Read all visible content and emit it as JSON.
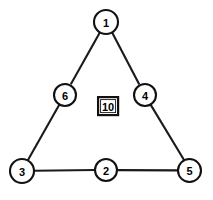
{
  "diagram": {
    "type": "magic-triangle-graph",
    "canvas": {
      "width": 213,
      "height": 200,
      "background": "#ffffff"
    },
    "style": {
      "line_color": "#1a1a1a",
      "node_fill": "#ffffff",
      "node_stroke": "#111111",
      "label_color": "#000000",
      "stroke_width": 2.1
    },
    "nodes": [
      {
        "id": "n1",
        "label": "1",
        "cx": 106,
        "cy": 22,
        "r": 12,
        "role": "apex-vertex"
      },
      {
        "id": "n6",
        "label": "6",
        "cx": 65,
        "cy": 95,
        "r": 11,
        "role": "left-side-midpoint"
      },
      {
        "id": "n4",
        "label": "4",
        "cx": 145,
        "cy": 95,
        "r": 11,
        "role": "right-side-midpoint"
      },
      {
        "id": "n3",
        "label": "3",
        "cx": 22,
        "cy": 171,
        "r": 12,
        "role": "bottom-left-vertex"
      },
      {
        "id": "n2",
        "label": "2",
        "cx": 106,
        "cy": 170,
        "r": 11,
        "role": "bottom-side-midpoint"
      },
      {
        "id": "n5",
        "label": "5",
        "cx": 189.5,
        "cy": 170.5,
        "r": 11.5,
        "role": "bottom-right-vertex"
      }
    ],
    "edges": [
      {
        "id": "e1",
        "from": "n1",
        "to": "n6",
        "side": "left"
      },
      {
        "id": "e2",
        "from": "n6",
        "to": "n3",
        "side": "left"
      },
      {
        "id": "e3",
        "from": "n1",
        "to": "n4",
        "side": "right"
      },
      {
        "id": "e4",
        "from": "n4",
        "to": "n5",
        "side": "right"
      },
      {
        "id": "e5",
        "from": "n3",
        "to": "n2",
        "side": "bottom"
      },
      {
        "id": "e6",
        "from": "n2",
        "to": "n5",
        "side": "bottom"
      }
    ],
    "center_box": {
      "label": "10",
      "x": 97,
      "y": 96,
      "width": 22,
      "height": 20,
      "meaning": "side sum"
    }
  }
}
